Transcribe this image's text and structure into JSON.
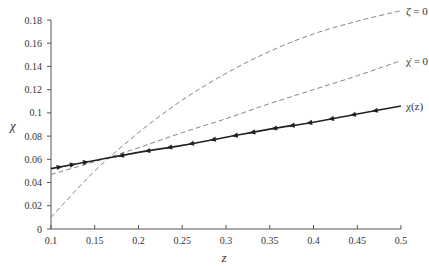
{
  "chart_data": {
    "type": "line",
    "title": "",
    "xlabel": "z",
    "ylabel": "χ",
    "xlim": [
      0.1,
      0.5
    ],
    "ylim": [
      0,
      0.18
    ],
    "grid": false,
    "legend_position": "inline-right",
    "x_ticks": [
      "0.1",
      "0.15",
      "0.2",
      "0.25",
      "0.3",
      "0.35",
      "0.4",
      "0.45",
      "0.5"
    ],
    "y_ticks": [
      "0",
      "0.02",
      "0.04",
      "0.06",
      "0.08",
      "0.1",
      "0.12",
      "0.14",
      "0.16",
      "0.18"
    ],
    "x": [
      0.1,
      0.15,
      0.2,
      0.25,
      0.3,
      0.35,
      0.4,
      0.45,
      0.5
    ],
    "series": [
      {
        "name": "ζ̇ = 0",
        "style": "dashed",
        "color": "#777777",
        "values": [
          0.01,
          0.05,
          0.083,
          0.111,
          0.134,
          0.153,
          0.168,
          0.179,
          0.188
        ]
      },
      {
        "name": "χ̇ = 0",
        "style": "dashed",
        "color": "#777777",
        "values": [
          0.047,
          0.058,
          0.07,
          0.083,
          0.095,
          0.108,
          0.12,
          0.132,
          0.145
        ]
      },
      {
        "name": "χ(z)",
        "style": "solid-with-arrows",
        "color": "#222222",
        "values": [
          0.052,
          0.059,
          0.066,
          0.072,
          0.079,
          0.086,
          0.092,
          0.099,
          0.106
        ],
        "arrow_markers_x": [
          0.11,
          0.125,
          0.14,
          0.18,
          0.21,
          0.235,
          0.26,
          0.285,
          0.31,
          0.33,
          0.355,
          0.375,
          0.395,
          0.42,
          0.445,
          0.47
        ],
        "arrow_direction_note": "arrows point right below z≈0.16, left above"
      }
    ],
    "annotations": [
      {
        "text": "ζ̇ = 0",
        "x": 0.5,
        "y": 0.188
      },
      {
        "text": "χ̇ = 0",
        "x": 0.5,
        "y": 0.145
      },
      {
        "text": "χ(z)",
        "x": 0.5,
        "y": 0.106
      }
    ]
  }
}
